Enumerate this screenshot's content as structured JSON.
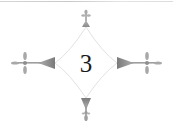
{
  "ornament": {
    "chapter_number": "3",
    "style": "diamond-with-fleur-cross-tips",
    "colors": {
      "text": "#1a1a1a",
      "triangle_fill": "#8a8a8a",
      "cross_fill": "#9a9a9a",
      "outline": "#e2e2e2",
      "background": "#ffffff"
    }
  }
}
